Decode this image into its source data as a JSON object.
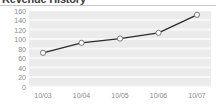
{
  "widget": {
    "title": "Revenue History"
  },
  "chart_data": {
    "type": "line",
    "title": "Revenue History",
    "xlabel": "",
    "ylabel": "",
    "categories": [
      "10/03",
      "10/04",
      "10/05",
      "10/06",
      "10/07"
    ],
    "values": [
      72,
      93,
      102,
      114,
      152
    ],
    "series": [
      {
        "name": "Revenue",
        "values": [
          72,
          93,
          102,
          114,
          152
        ]
      }
    ],
    "ylim": [
      0,
      160
    ],
    "ytick_step": 20,
    "yticks": [
      "160",
      "140",
      "120",
      "100",
      "80",
      "60",
      "40",
      "20",
      "0"
    ],
    "xticks": [
      "10/03",
      "10/04",
      "10/05",
      "10/06",
      "10/07"
    ],
    "grid": true,
    "grid_orientation": "horizontal",
    "legend": false,
    "legend_position": "none",
    "marker": "circle-open",
    "colors": {
      "line": "#2b2b2b",
      "marker_fill": "#ffffff",
      "marker_stroke": "#7a7a7a",
      "plot_background": "#ebebeb",
      "gridline": "#f7f7f7",
      "tick_label": "#8a8a8a",
      "title": "#3b3b3b",
      "rule": "#c9c9c9"
    }
  }
}
